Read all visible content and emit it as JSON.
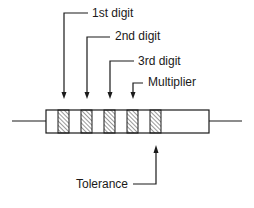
{
  "diagram": {
    "type": "resistor-color-code",
    "labels": {
      "first_digit": "1st digit",
      "second_digit": "2nd digit",
      "third_digit": "3rd digit",
      "multiplier": "Multiplier",
      "tolerance": "Tolerance"
    },
    "bands": [
      {
        "name": "1st digit",
        "x": 58
      },
      {
        "name": "2nd digit",
        "x": 81
      },
      {
        "name": "3rd digit",
        "x": 104
      },
      {
        "name": "Multiplier",
        "x": 127
      },
      {
        "name": "Tolerance",
        "x": 150
      }
    ],
    "colors": {
      "stroke": "#1a1a1a",
      "background": "#ffffff"
    }
  }
}
